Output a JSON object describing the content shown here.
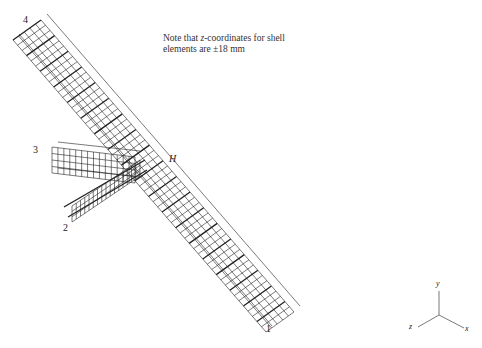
{
  "figure": {
    "note_line1": "Note that z-coordinates for shell",
    "note_line2": "elements are ±18 mm",
    "node_labels": {
      "n1": "1",
      "n2": "2",
      "n3": "3",
      "n4": "4",
      "H": "H"
    },
    "axes": {
      "x": "x",
      "y": "y",
      "z": "z"
    },
    "colors": {
      "mesh": "#222222",
      "background": "#ffffff"
    }
  }
}
